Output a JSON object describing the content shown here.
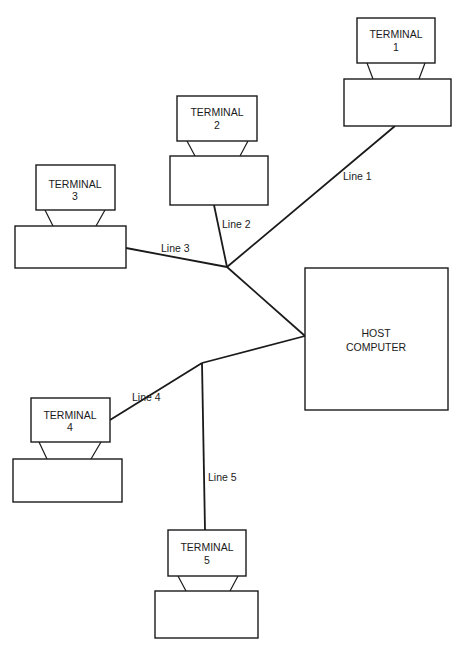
{
  "diagram": {
    "type": "star-network",
    "host": {
      "line1": "HOST",
      "line2": "COMPUTER"
    },
    "terminals": [
      {
        "name": "TERMINAL",
        "number": "1"
      },
      {
        "name": "TERMINAL",
        "number": "2"
      },
      {
        "name": "TERMINAL",
        "number": "3"
      },
      {
        "name": "TERMINAL",
        "number": "4"
      },
      {
        "name": "TERMINAL",
        "number": "5"
      }
    ],
    "lines": [
      {
        "label": "Line 1"
      },
      {
        "label": "Line 2"
      },
      {
        "label": "Line 3"
      },
      {
        "label": "Line 4"
      },
      {
        "label": "Line 5"
      }
    ]
  }
}
